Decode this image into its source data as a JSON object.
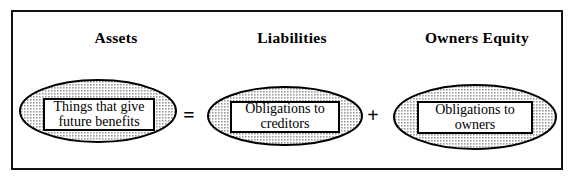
{
  "diagram": {
    "frame": {
      "border_color": "#111111"
    },
    "columns": [
      {
        "heading": "Assets",
        "bubble_text_line1": "Things that give",
        "bubble_text_line2": "future benefits"
      },
      {
        "heading": "Liabilities",
        "bubble_text_line1": "Obligations to",
        "bubble_text_line2": "creditors"
      },
      {
        "heading": "Owners Equity",
        "bubble_text_line1": "Obligations to",
        "bubble_text_line2": "owners"
      }
    ],
    "operators": {
      "equals": "=",
      "plus": "+"
    },
    "colors": {
      "ellipse_fill": "#cccccc",
      "ellipse_stroke": "#000000",
      "box_fill": "#ffffff",
      "box_stroke": "#000000",
      "text": "#000000",
      "background": "#ffffff"
    }
  }
}
